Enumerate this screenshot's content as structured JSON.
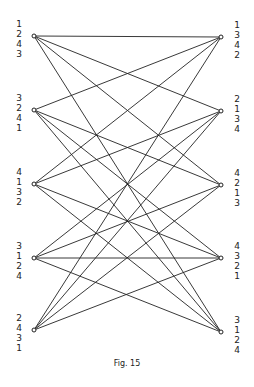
{
  "figure": {
    "caption": "Fig. 15",
    "line_color": "#222222",
    "left_nodes": [
      {
        "id": "L1",
        "x": 34,
        "y": 36,
        "label": [
          "1",
          "2",
          "4",
          "3"
        ]
      },
      {
        "id": "L2",
        "x": 34,
        "y": 110,
        "label": [
          "3",
          "2",
          "4",
          "1"
        ]
      },
      {
        "id": "L3",
        "x": 34,
        "y": 184,
        "label": [
          "4",
          "1",
          "3",
          "2"
        ]
      },
      {
        "id": "L4",
        "x": 34,
        "y": 258,
        "label": [
          "3",
          "1",
          "2",
          "4"
        ]
      },
      {
        "id": "L5",
        "x": 34,
        "y": 330,
        "label": [
          "2",
          "4",
          "3",
          "1"
        ]
      }
    ],
    "right_nodes": [
      {
        "id": "R1",
        "x": 221,
        "y": 37,
        "label": [
          "1",
          "3",
          "4",
          "2"
        ]
      },
      {
        "id": "R2",
        "x": 221,
        "y": 111,
        "label": [
          "2",
          "1",
          "3",
          "4"
        ]
      },
      {
        "id": "R3",
        "x": 221,
        "y": 185,
        "label": [
          "4",
          "2",
          "1",
          "3"
        ]
      },
      {
        "id": "R4",
        "x": 221,
        "y": 258,
        "label": [
          "4",
          "3",
          "2",
          "1"
        ]
      },
      {
        "id": "R5",
        "x": 221,
        "y": 332,
        "label": [
          "3",
          "1",
          "2",
          "4"
        ]
      }
    ],
    "edges": [
      [
        "L1",
        "R1"
      ],
      [
        "L1",
        "R2"
      ],
      [
        "L1",
        "R3"
      ],
      [
        "L1",
        "R5"
      ],
      [
        "L2",
        "R1"
      ],
      [
        "L2",
        "R3"
      ],
      [
        "L2",
        "R4"
      ],
      [
        "L2",
        "R5"
      ],
      [
        "L3",
        "R1"
      ],
      [
        "L3",
        "R2"
      ],
      [
        "L3",
        "R4"
      ],
      [
        "L3",
        "R5"
      ],
      [
        "L4",
        "R2"
      ],
      [
        "L4",
        "R3"
      ],
      [
        "L4",
        "R4"
      ],
      [
        "L4",
        "R5"
      ],
      [
        "L5",
        "R1"
      ],
      [
        "L5",
        "R2"
      ],
      [
        "L5",
        "R3"
      ],
      [
        "L5",
        "R4"
      ]
    ]
  }
}
